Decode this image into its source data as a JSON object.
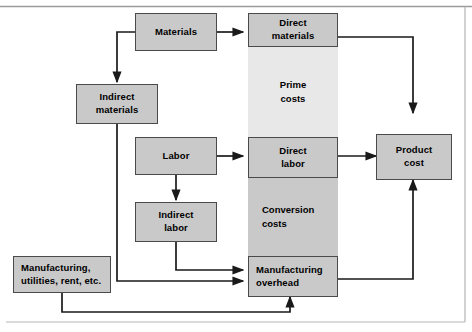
{
  "diagram": {
    "colors": {
      "box_fill": "#c9c9c9",
      "box_border": "#4a4a4a",
      "band_prime_fill": "#e8e8e8",
      "band_conversion_fill": "#c9c9c9",
      "connector": "#1a1a1a",
      "frame_rule": "#9a9a9a",
      "page_background": "#ffffff"
    },
    "frame": {
      "top_rule": true,
      "right_rule": true,
      "bottom_rule": true
    },
    "nodes": [
      {
        "id": "materials",
        "label": "Materials",
        "lines": [
          "Materials"
        ]
      },
      {
        "id": "indirect-materials",
        "label": "Indirect materials",
        "lines": [
          "Indirect",
          "materials"
        ]
      },
      {
        "id": "labor",
        "label": "Labor",
        "lines": [
          "Labor"
        ]
      },
      {
        "id": "indirect-labor",
        "label": "Indirect labor",
        "lines": [
          "Indirect",
          "labor"
        ]
      },
      {
        "id": "manufacturing-utilities",
        "label": "Manufacturing, utilities, rent, etc.",
        "lines": [
          "Manufacturing,",
          "utilities, rent, etc."
        ]
      },
      {
        "id": "direct-materials",
        "label": "Direct materials",
        "lines": [
          "Direct",
          "materials"
        ]
      },
      {
        "id": "direct-labor",
        "label": "Direct labor",
        "lines": [
          "Direct",
          "labor"
        ]
      },
      {
        "id": "manufacturing-overhead",
        "label": "Manufacturing overhead",
        "lines": [
          "Manufacturing",
          "overhead"
        ]
      },
      {
        "id": "product-cost",
        "label": "Product cost",
        "lines": [
          "Product",
          "cost"
        ]
      }
    ],
    "bands": [
      {
        "id": "prime-costs",
        "label": "Prime costs",
        "lines": [
          "Prime",
          "costs"
        ]
      },
      {
        "id": "conversion-costs",
        "label": "Conversion costs",
        "lines": [
          "Conversion",
          "costs"
        ]
      }
    ],
    "labels": {
      "materials": "Materials",
      "materials_l1": "Materials",
      "indirect_materials_l1": "Indirect",
      "indirect_materials_l2": "materials",
      "labor_l1": "Labor",
      "indirect_labor_l1": "Indirect",
      "indirect_labor_l2": "labor",
      "manufacturing_utilities_l1": "Manufacturing,",
      "manufacturing_utilities_l2": "utilities, rent, etc.",
      "direct_materials_l1": "Direct",
      "direct_materials_l2": "materials",
      "direct_labor_l1": "Direct",
      "direct_labor_l2": "labor",
      "manufacturing_overhead_l1": "Manufacturing",
      "manufacturing_overhead_l2": "overhead",
      "product_cost_l1": "Product",
      "product_cost_l2": "cost",
      "prime_costs_l1": "Prime",
      "prime_costs_l2": "costs",
      "conversion_costs_l1": "Conversion",
      "conversion_costs_l2": "costs"
    },
    "edges": [
      {
        "id": "materials-to-direct-materials",
        "from": "materials",
        "to": "direct-materials",
        "arrow": true
      },
      {
        "id": "materials-to-indirect-materials",
        "from": "materials",
        "to": "indirect-materials",
        "arrow": true
      },
      {
        "id": "indirect-materials-to-overhead",
        "from": "indirect-materials",
        "to": "manufacturing-overhead",
        "arrow": true
      },
      {
        "id": "labor-to-direct-labor",
        "from": "labor",
        "to": "direct-labor",
        "arrow": true
      },
      {
        "id": "labor-to-indirect-labor",
        "from": "labor",
        "to": "indirect-labor",
        "arrow": true
      },
      {
        "id": "indirect-labor-to-overhead",
        "from": "indirect-labor",
        "to": "manufacturing-overhead",
        "arrow": true
      },
      {
        "id": "utilities-to-overhead",
        "from": "manufacturing-utilities",
        "to": "manufacturing-overhead",
        "arrow": true
      },
      {
        "id": "direct-materials-to-product-cost",
        "from": "direct-materials",
        "to": "product-cost",
        "arrow": true
      },
      {
        "id": "direct-labor-to-product-cost",
        "from": "direct-labor",
        "to": "product-cost",
        "arrow": true
      },
      {
        "id": "overhead-to-product-cost",
        "from": "manufacturing-overhead",
        "to": "product-cost",
        "arrow": true
      }
    ]
  }
}
